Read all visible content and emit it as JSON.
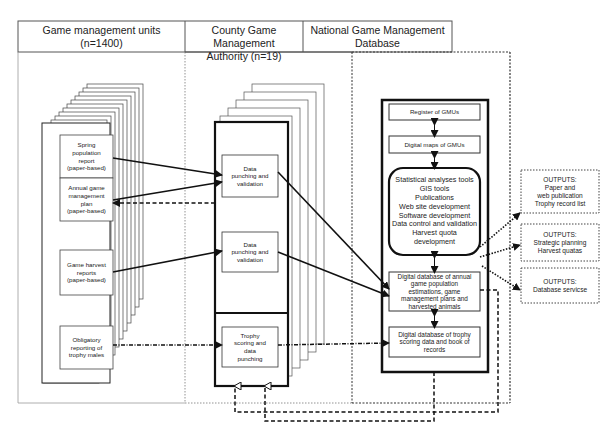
{
  "columns": [
    {
      "title_line1": "Game management units",
      "title_line2": "(n=1400)"
    },
    {
      "title_line1": "County Game Management",
      "title_line2": "Authority (n=19)"
    },
    {
      "title_line1": "National Game Management",
      "title_line2": "Database"
    }
  ],
  "gmu_boxes": [
    {
      "lines": [
        "Spring",
        "population",
        "report",
        "(paper-based)"
      ]
    },
    {
      "lines": [
        "Annual game",
        "management",
        "plan",
        "(paper-based)"
      ]
    },
    {
      "lines": [
        "Game harvest",
        "reports",
        "(paper-based)"
      ]
    },
    {
      "lines": [
        "Obligatory",
        "reporting of",
        "trophy males"
      ]
    }
  ],
  "county_boxes": [
    {
      "lines": [
        "Data",
        "punching and",
        "validation"
      ]
    },
    {
      "lines": [
        "Data",
        "punching and",
        "validation"
      ]
    },
    {
      "lines": [
        "Trophy",
        "scoring and",
        "data",
        "punching"
      ]
    }
  ],
  "national_boxes": {
    "register": "Register of GMUs",
    "maps": "Digital maps of GMUs",
    "tools": [
      "Statistical analyses tools",
      "GIS tools",
      "Publications",
      "Web site development",
      "Software development",
      "Data control and validation",
      "Harvest quota",
      "development"
    ],
    "annual_db": [
      "Digital database of annual",
      "game population",
      "estimations, game",
      "management plans and",
      "harvested animals"
    ],
    "trophy_db": [
      "Digital database of trophy",
      "scoring data and book of",
      "records"
    ]
  },
  "outputs": [
    {
      "lines": [
        "OUTPUTS:",
        "Paper and",
        "web publication",
        "Trophy record list"
      ]
    },
    {
      "lines": [
        "OUTPUTS:",
        "Strategic planning",
        "Harvest quatas"
      ]
    },
    {
      "lines": [
        "OUTPUTS:",
        "Database servicse"
      ]
    }
  ]
}
